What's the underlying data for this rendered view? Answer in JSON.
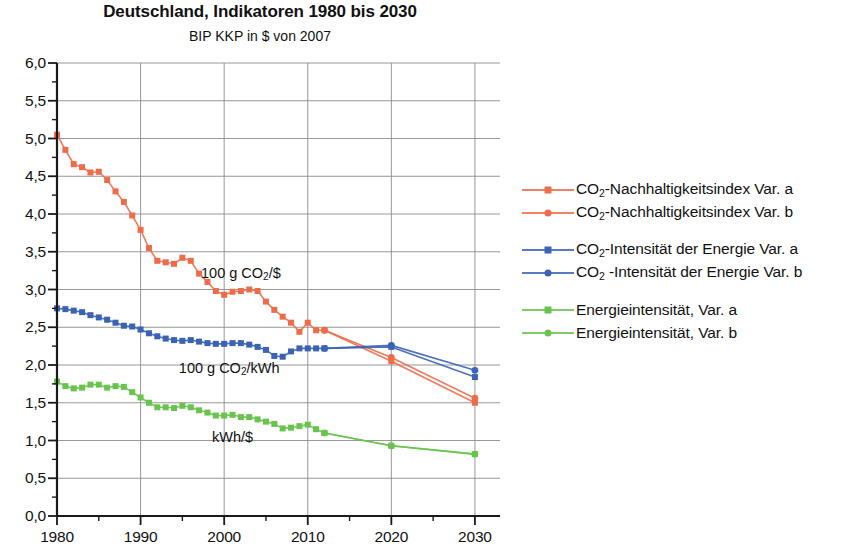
{
  "header": {
    "title": "Deutschland, Indikatoren 1980 bis 2030",
    "subtitle": "BIP KKP in $ von 2007"
  },
  "legend": {
    "groups": [
      {
        "items": [
          {
            "label": "CO2-Nachhaltigkeitsindex Var. a",
            "pre": "CO",
            "sub": "2",
            "post": "-Nachhaltigkeitsindex Var. a",
            "color": "#ef6c4a",
            "marker": "square"
          },
          {
            "label": "CO2-Nachhaltigkeitsindex Var. b",
            "pre": "CO",
            "sub": "2",
            "post": "-Nachhaltigkeitsindex Var. b",
            "color": "#ef6c4a",
            "marker": "circle"
          }
        ]
      },
      {
        "items": [
          {
            "label": "CO2-Intensität der Energie Var. a",
            "pre": "CO",
            "sub": "2",
            "post": "-Intensität der Energie Var. a",
            "color": "#3b63b5",
            "marker": "square"
          },
          {
            "label": "CO2 -Intensität der Energie Var. b",
            "pre": "CO",
            "sub": "2",
            "post": " -Intensität der Energie Var. b",
            "color": "#3b63b5",
            "marker": "circle"
          }
        ]
      },
      {
        "items": [
          {
            "label": "Energieintensität, Var. a",
            "pre": "",
            "sub": "",
            "post": "Energieintensität, Var. a",
            "color": "#69c44d",
            "marker": "square"
          },
          {
            "label": "Energieintensität, Var. b",
            "pre": "",
            "sub": "",
            "post": "Energieintensität, Var. b",
            "color": "#69c44d",
            "marker": "circle"
          }
        ]
      }
    ]
  },
  "chart_data": {
    "type": "line",
    "title": "Deutschland, Indikatoren 1980 bis 2030",
    "subtitle": "BIP KKP in $ von 2007",
    "xlabel": "",
    "ylabel": "",
    "xlim": [
      1980,
      2033
    ],
    "ylim": [
      0.0,
      6.0
    ],
    "xticks": [
      1980,
      1990,
      2000,
      2010,
      2020,
      2030
    ],
    "xtick_labels": [
      "1980",
      "1990",
      "2000",
      "2010",
      "2020",
      "2030"
    ],
    "xminor_step": 5,
    "yticks": [
      0.0,
      0.5,
      1.0,
      1.5,
      2.0,
      2.5,
      3.0,
      3.5,
      4.0,
      4.5,
      5.0,
      5.5,
      6.0
    ],
    "ytick_labels": [
      "0,0",
      "0,5",
      "1,0",
      "1,5",
      "2,0",
      "2,5",
      "3,0",
      "3,5",
      "4,0",
      "4,5",
      "5,0",
      "5,5",
      "6,0"
    ],
    "yminor_step": 0.25,
    "grid": true,
    "legend_position": "right",
    "annotations": [
      {
        "text": "100 g CO2/$",
        "pre": "100 g CO",
        "sub": "2",
        "post": "/$",
        "x": 2002.0,
        "y": 3.22
      },
      {
        "text": "100 g CO2/kWh",
        "pre": "100 g CO",
        "sub": "2",
        "post": "/kWh",
        "x": 2000.6,
        "y": 1.96
      },
      {
        "text": "kWh/$",
        "pre": "",
        "sub": "",
        "post": "kWh/$",
        "x": 2001.0,
        "y": 1.05
      }
    ],
    "series": [
      {
        "name": "CO2-Nachhaltigkeitsindex Var. a",
        "color": "#ef6c4a",
        "marker": "square",
        "x": [
          1980,
          1981,
          1982,
          1983,
          1984,
          1985,
          1986,
          1987,
          1988,
          1989,
          1990,
          1991,
          1992,
          1993,
          1994,
          1995,
          1996,
          1997,
          1998,
          1999,
          2000,
          2001,
          2002,
          2003,
          2004,
          2005,
          2006,
          2007,
          2008,
          2009,
          2010,
          2011,
          2012,
          2020,
          2030
        ],
        "values": [
          5.05,
          4.85,
          4.66,
          4.62,
          4.55,
          4.56,
          4.45,
          4.3,
          4.16,
          3.98,
          3.79,
          3.55,
          3.38,
          3.36,
          3.34,
          3.42,
          3.38,
          3.21,
          3.1,
          2.98,
          2.93,
          2.97,
          2.98,
          3.0,
          2.98,
          2.84,
          2.73,
          2.64,
          2.56,
          2.44,
          2.56,
          2.46,
          2.46,
          2.05,
          1.5
        ]
      },
      {
        "name": "CO2-Nachhaltigkeitsindex Var. b",
        "color": "#ef6c4a",
        "marker": "circle",
        "x": [
          2012,
          2020,
          2030
        ],
        "values": [
          2.46,
          2.1,
          1.56
        ]
      },
      {
        "name": "CO2-Intensität der Energie Var. a",
        "color": "#3b63b5",
        "marker": "square",
        "x": [
          1980,
          1981,
          1982,
          1983,
          1984,
          1985,
          1986,
          1987,
          1988,
          1989,
          1990,
          1991,
          1992,
          1993,
          1994,
          1995,
          1996,
          1997,
          1998,
          1999,
          2000,
          2001,
          2002,
          2003,
          2004,
          2005,
          2006,
          2007,
          2008,
          2009,
          2010,
          2011,
          2012,
          2020,
          2030
        ],
        "values": [
          2.75,
          2.74,
          2.72,
          2.7,
          2.66,
          2.63,
          2.6,
          2.56,
          2.52,
          2.51,
          2.47,
          2.42,
          2.38,
          2.35,
          2.33,
          2.32,
          2.33,
          2.31,
          2.29,
          2.28,
          2.28,
          2.29,
          2.29,
          2.27,
          2.24,
          2.2,
          2.12,
          2.11,
          2.18,
          2.22,
          2.22,
          2.22,
          2.22,
          2.24,
          1.84
        ]
      },
      {
        "name": "CO2 -Intensität der Energie Var. b",
        "color": "#3b63b5",
        "marker": "circle",
        "x": [
          2012,
          2020,
          2030
        ],
        "values": [
          2.22,
          2.26,
          1.93
        ]
      },
      {
        "name": "Energieintensität, Var. a",
        "color": "#69c44d",
        "marker": "square",
        "x": [
          1980,
          1981,
          1982,
          1983,
          1984,
          1985,
          1986,
          1987,
          1988,
          1989,
          1990,
          1991,
          1992,
          1993,
          1994,
          1995,
          1996,
          1997,
          1998,
          1999,
          2000,
          2001,
          2002,
          2003,
          2004,
          2005,
          2006,
          2007,
          2008,
          2009,
          2010,
          2011,
          2012,
          2020,
          2030
        ],
        "values": [
          1.78,
          1.72,
          1.69,
          1.7,
          1.74,
          1.74,
          1.7,
          1.72,
          1.71,
          1.64,
          1.57,
          1.5,
          1.44,
          1.44,
          1.43,
          1.46,
          1.44,
          1.4,
          1.37,
          1.33,
          1.33,
          1.34,
          1.31,
          1.31,
          1.28,
          1.25,
          1.22,
          1.16,
          1.17,
          1.19,
          1.21,
          1.15,
          1.1,
          0.93,
          0.82
        ]
      },
      {
        "name": "Energieintensität, Var. b",
        "color": "#69c44d",
        "marker": "circle",
        "x": [
          2012,
          2020,
          2030
        ],
        "values": [
          1.1,
          0.93,
          0.82
        ]
      }
    ]
  }
}
